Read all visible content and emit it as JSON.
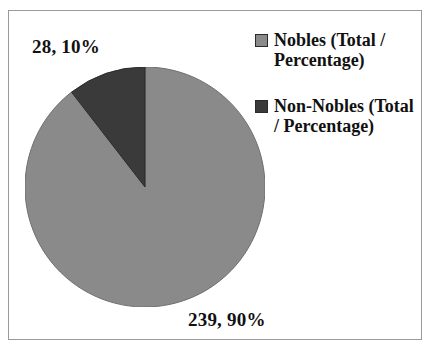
{
  "chart_data": {
    "type": "pie",
    "title": "",
    "categories": [
      "Nobles (Total / Percentage)",
      "Non-Nobles (Total / Percentage)"
    ],
    "values": [
      239,
      28
    ],
    "percentages": [
      90,
      10
    ],
    "total": 267,
    "legend_position": "right",
    "grid": false,
    "start_angle_deg": 0,
    "direction": "clockwise",
    "slices": [
      {
        "name": "Nobles (Total / Percentage)",
        "value": 239,
        "percent": 90,
        "label": "239, 90%",
        "color": "#8a8a8a",
        "sweep_deg": 324
      },
      {
        "name": "Non-Nobles (Total / Percentage)",
        "value": 28,
        "percent": 10,
        "label": "28, 10%",
        "color": "#3a3a3a",
        "sweep_deg": 36
      }
    ]
  },
  "labels": {
    "non_nobles": "28, 10%",
    "nobles": "239, 90%"
  },
  "legend": {
    "items": [
      {
        "label": "Nobles (Total / Percentage)",
        "color": "#8a8a8a"
      },
      {
        "label": "Non-Nobles (Total / Percentage)",
        "color": "#3a3a3a"
      }
    ]
  },
  "colors": {
    "nobles": "#8a8a8a",
    "non_nobles": "#3a3a3a",
    "frame": "#9a9a9a",
    "background": "#ffffff",
    "text": "#111111"
  }
}
